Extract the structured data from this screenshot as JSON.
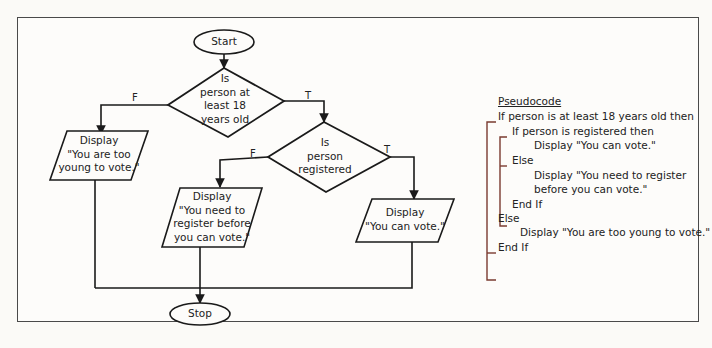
{
  "flowchart": {
    "start": "Start",
    "stop": "Stop",
    "decision1": {
      "lines": [
        "Is",
        "person at",
        "least 18",
        "years old"
      ],
      "true_label": "T",
      "false_label": "F"
    },
    "decision2": {
      "lines": [
        "Is",
        "person",
        "registered"
      ],
      "true_label": "T",
      "false_label": "F"
    },
    "output_too_young": {
      "lines": [
        "Display",
        "\"You are too",
        "young to vote.\""
      ]
    },
    "output_register": {
      "lines": [
        "Display",
        "\"You need to",
        "register before",
        "you can vote.\""
      ]
    },
    "output_can_vote": {
      "lines": [
        "Display",
        "\"You can vote.\""
      ]
    }
  },
  "pseudocode": {
    "title": "Pseudocode",
    "lines": [
      "If person is at least 18 years old then",
      "If person is registered then",
      "Display \"You can vote.\"",
      "Else",
      "Display \"You need to register",
      "before you can vote.\"",
      "End If",
      "Else",
      "Display \"You are too young to vote.\"",
      "End If"
    ],
    "bracket_color": "#7a3b30"
  },
  "colors": {
    "stroke": "#1a1a1a",
    "frame": "#4a4a4a",
    "background": "#fbfaf7"
  }
}
